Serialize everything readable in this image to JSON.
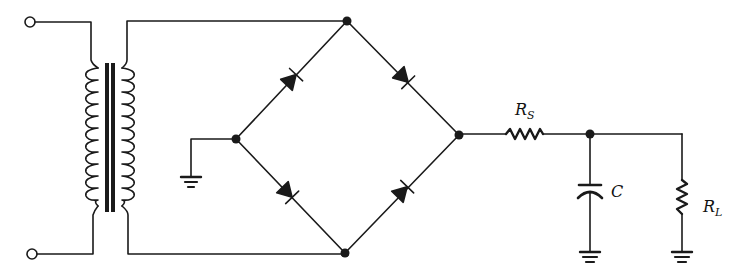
{
  "diagram": {
    "type": "full-wave bridge rectifier with RC filter",
    "stroke_color": "#1a1a1a",
    "background": "#ffffff",
    "components": {
      "transformer": {
        "primary_turns": 11,
        "secondary_turns": 11
      },
      "bridge": {
        "diodes": 4
      },
      "series_resistor": {
        "label_main": "R",
        "label_sub": "S"
      },
      "capacitor": {
        "label": "C"
      },
      "load_resistor": {
        "label_main": "R",
        "label_sub": "L"
      },
      "grounds": 3,
      "input_terminals": 2
    }
  }
}
